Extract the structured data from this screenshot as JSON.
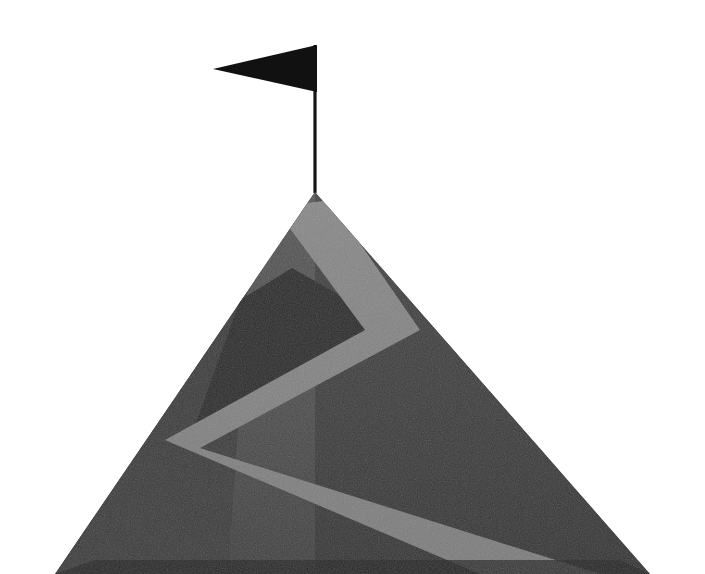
{
  "artwork": {
    "title": "Mountain Summit with Flag",
    "subject": "mountain-peak-goal-illustration",
    "style": "flat vector with grain texture",
    "background_color": "#ffffff",
    "canvas": {
      "width": 705,
      "height": 574
    }
  },
  "palette": {
    "background": "#ffffff",
    "mountain_light_face": "#4c4c4c",
    "mountain_dark_face": "#3c3c3c",
    "mountain_shadow_wedge": "#2c2c2c",
    "mountain_base_shadow": "#242424",
    "path_light": "#808080",
    "path_highlight": "#8a8a8a",
    "flag": "#111111",
    "flag_pole": "#141414"
  },
  "elements": {
    "mountain": {
      "label": "Mountain",
      "peak": {
        "x": 315,
        "y": 192
      },
      "base_left": {
        "x": 55,
        "y": 574
      },
      "base_right": {
        "x": 650,
        "y": 574
      },
      "outline_points": "315,192 650,574 55,574",
      "light_face_points": "315,192 315,574 55,574",
      "dark_face_points": "315,192 650,574 315,574",
      "sub_ridge_points": "315,192 250,256 228,574 55,574",
      "shadow_wedge_points": "292,268 400,330 190,440 240,300",
      "base_shadow_points": "55,574 650,574 620,560 95,560"
    },
    "path": {
      "label": "Summit trail",
      "color": "#808080",
      "segments": [
        {
          "from": {
            "x": 297,
            "y": 208
          },
          "to": {
            "x": 400,
            "y": 330
          }
        },
        {
          "from": {
            "x": 400,
            "y": 330
          },
          "to": {
            "x": 190,
            "y": 440
          }
        },
        {
          "from": {
            "x": 190,
            "y": 440
          },
          "to": {
            "x": 560,
            "y": 574
          }
        }
      ],
      "band_points": "293,205 330,200 420,330 200,448 600,574 480,574 165,440 365,330 280,215"
    },
    "flag": {
      "label": "Summit flag",
      "shape": "pennant",
      "direction": "left",
      "fly_tip": {
        "x": 213,
        "y": 69
      },
      "hoist_top": {
        "x": 317,
        "y": 45
      },
      "hoist_bottom": {
        "x": 317,
        "y": 92
      },
      "pennant_points": "317,45 317,92 213,69",
      "pole": {
        "x": 315,
        "top_y": 45,
        "bottom_y": 193,
        "width": 3.2,
        "color": "#141414"
      }
    }
  },
  "accessibility": {
    "alt_text": "Flat illustration of a dark gray mountain with a black pennant flag planted at its summit and a light gray zigzag trail winding up the slope"
  }
}
